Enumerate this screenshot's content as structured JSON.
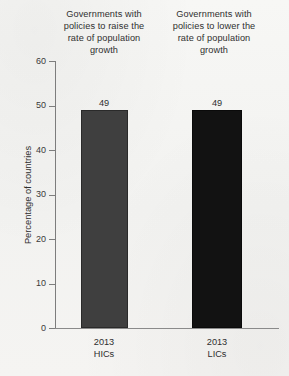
{
  "chart_data": {
    "type": "bar",
    "title": "",
    "xlabel": "",
    "ylabel": "Percentage of countries",
    "ylim": [
      0,
      60
    ],
    "yticks": [
      "0",
      "10",
      "20",
      "30",
      "40",
      "50",
      "60"
    ],
    "grid": false,
    "legend": "none",
    "categories": [
      "2013 HICs",
      "2013 LICs"
    ],
    "values": [
      49,
      49
    ],
    "value_labels": [
      "49",
      "49"
    ],
    "bar_colors": [
      "#3f3f3f",
      "#121212"
    ],
    "column_headers": [
      "Governments with policies to raise the rate of population growth",
      "Governments with policies to lower the rate of population growth"
    ],
    "x_tick_labels": [
      {
        "year": "2013",
        "group": "HICs"
      },
      {
        "year": "2013",
        "group": "LICs"
      }
    ]
  },
  "axes": {
    "y_title": "Percentage of countries",
    "y_ticks": [
      {
        "label": "60",
        "value": 60
      },
      {
        "label": "50",
        "value": 50
      },
      {
        "label": "40",
        "value": 40
      },
      {
        "label": "30",
        "value": 30
      },
      {
        "label": "20",
        "value": 20
      },
      {
        "label": "10",
        "value": 10
      },
      {
        "label": "0",
        "value": 0
      }
    ]
  },
  "headers": {
    "col1": "Governments with policies to raise the rate of population growth",
    "col2": "Governments with policies to lower the rate of population growth"
  },
  "colors": {
    "background": "#f4f4f2",
    "bar_hics": "#3f3f3f",
    "bar_lics": "#121212",
    "axis": "#7d7d7d",
    "text": "#2f2f2f"
  }
}
